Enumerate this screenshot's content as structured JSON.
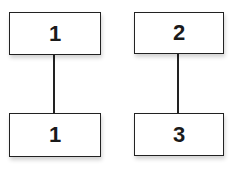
{
  "diagram": {
    "type": "tree",
    "nodes": [
      {
        "id": "a",
        "label": "1",
        "x": 9,
        "y": 12,
        "w": 92,
        "h": 43
      },
      {
        "id": "b",
        "label": "1",
        "x": 9,
        "y": 113,
        "w": 92,
        "h": 44
      },
      {
        "id": "c",
        "label": "2",
        "x": 134,
        "y": 12,
        "w": 90,
        "h": 42
      },
      {
        "id": "d",
        "label": "3",
        "x": 134,
        "y": 113,
        "w": 90,
        "h": 43
      }
    ],
    "edges": [
      {
        "from": "a",
        "to": "b"
      },
      {
        "from": "c",
        "to": "d"
      }
    ],
    "colors": {
      "stroke": "#222222",
      "fill": "#ffffff",
      "text": "#1a1a1a"
    }
  }
}
